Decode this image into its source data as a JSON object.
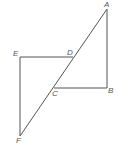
{
  "diagram": {
    "type": "geometry",
    "points": {
      "A": {
        "label": "A",
        "x": 107,
        "y": 9,
        "lx": 104,
        "ly": 7
      },
      "B": {
        "label": "B",
        "x": 107,
        "y": 88,
        "lx": 108,
        "ly": 93
      },
      "C": {
        "label": "C",
        "x": 54,
        "y": 88,
        "lx": 52,
        "ly": 96
      },
      "D": {
        "label": "D",
        "x": 73,
        "y": 57,
        "lx": 67,
        "ly": 55
      },
      "E": {
        "label": "E",
        "x": 20,
        "y": 57,
        "lx": 13,
        "ly": 56
      },
      "F": {
        "label": "F",
        "x": 20,
        "y": 136,
        "lx": 16,
        "ly": 143
      }
    },
    "segments": [
      [
        "A",
        "F"
      ],
      [
        "A",
        "B"
      ],
      [
        "B",
        "C"
      ],
      [
        "E",
        "D"
      ],
      [
        "E",
        "F"
      ]
    ],
    "colors": {
      "line": "#555555",
      "label": "#555555"
    }
  }
}
